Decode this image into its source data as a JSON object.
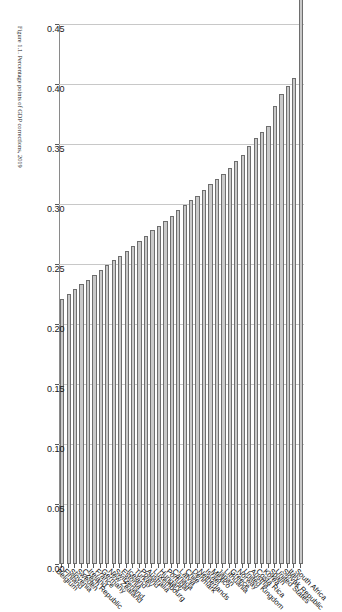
{
  "chart_data": {
    "type": "bar",
    "orientation": "horizontal-rotated",
    "title": "",
    "xlabel": "",
    "ylabel": "",
    "xlim": [
      0.0,
      0.45
    ],
    "grid": true,
    "legend": null,
    "tick_labels": [
      "0.45",
      "0.40",
      "0.35",
      "0.30",
      "0.25",
      "0.20",
      "0.15",
      "0.10",
      "0.05",
      "0.00"
    ],
    "tick_values": [
      0.45,
      0.4,
      0.35,
      0.3,
      0.25,
      0.2,
      0.15,
      0.1,
      0.05,
      0.0
    ],
    "categories": [
      "South Africa",
      "Italy",
      "Slovak Republic",
      "United States",
      "Spain",
      "Korea",
      "Costa Rica",
      "Austria",
      "United Kingdom",
      "Norway",
      "Greece",
      "Lithuania",
      "Japan",
      "Mexico",
      "Israel",
      "Netherlands",
      "Denmark",
      "Chile",
      "Latvia",
      "Canada",
      "Portugal",
      "Hungary",
      "Luxembourg",
      "Australia",
      "Poland",
      "Turkey",
      "Iceland",
      "Estonia",
      "Switzerland",
      "New Zealand",
      "Germany",
      "France",
      "Ireland",
      "Czech Republic",
      "Sweden",
      "Slovenia",
      "Finland",
      "Belgium"
    ],
    "values": [
      0.487,
      0.405,
      0.398,
      0.392,
      0.382,
      0.365,
      0.36,
      0.355,
      0.348,
      0.341,
      0.336,
      0.33,
      0.325,
      0.321,
      0.317,
      0.312,
      0.307,
      0.303,
      0.299,
      0.295,
      0.29,
      0.286,
      0.282,
      0.278,
      0.273,
      0.269,
      0.265,
      0.261,
      0.257,
      0.253,
      0.249,
      0.245,
      0.241,
      0.237,
      0.233,
      0.229,
      0.225,
      0.221
    ]
  },
  "caption": {
    "text": "Figure 1.1. Percentage points of GDP corrections, 2019"
  },
  "colors": {
    "bar_fill": "#c9c9c9",
    "bar_edge": "#6e6e6e",
    "gridline": "#c8c8c8",
    "axis": "#5a5a5a"
  }
}
